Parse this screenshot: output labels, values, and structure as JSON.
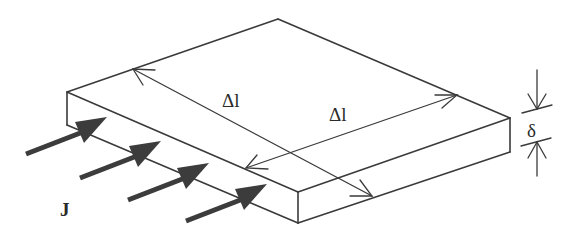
{
  "diagram": {
    "labels": {
      "delta_l_1": "Δl",
      "delta_l_2": "Δl",
      "thickness": "δ",
      "current_density": "J"
    },
    "colors": {
      "line": "#3a3a3a",
      "flux_arrow": "#3c3c3c",
      "background": "#ffffff"
    },
    "slab": {
      "top_back": [
        278,
        19
      ],
      "left_top": [
        67,
        92
      ],
      "left_bottom": [
        67,
        125
      ],
      "front_top": [
        298,
        192
      ],
      "front_bottom": [
        298,
        223
      ],
      "right_top": [
        510,
        118
      ],
      "right_bottom": [
        510,
        152
      ]
    },
    "flux_arrow_count": 4
  }
}
